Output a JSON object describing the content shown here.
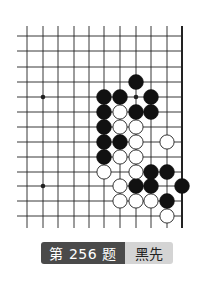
{
  "problem": {
    "title": "第 256 题",
    "to_play": "黑先"
  },
  "board": {
    "grid": {
      "x": [
        27,
        43,
        58,
        74,
        89,
        104,
        120,
        136,
        151,
        167,
        182
      ],
      "y": [
        36,
        51,
        67,
        82,
        97,
        112,
        127,
        142,
        157,
        172,
        186,
        201,
        216
      ],
      "x_extend_left": 17,
      "y_extend_top": 26,
      "y_extend_bottom": 228,
      "right_edge_col": 10
    },
    "star_points": [
      {
        "col": 1,
        "row": 4
      },
      {
        "col": 7,
        "row": 4
      },
      {
        "col": 1,
        "row": 10
      }
    ],
    "stones": {
      "black": [
        {
          "col": 7,
          "row": 3
        },
        {
          "col": 5,
          "row": 4
        },
        {
          "col": 6,
          "row": 4
        },
        {
          "col": 8,
          "row": 4
        },
        {
          "col": 5,
          "row": 5
        },
        {
          "col": 7,
          "row": 5
        },
        {
          "col": 8,
          "row": 5
        },
        {
          "col": 5,
          "row": 6
        },
        {
          "col": 5,
          "row": 7
        },
        {
          "col": 6,
          "row": 7
        },
        {
          "col": 5,
          "row": 8
        },
        {
          "col": 8,
          "row": 9
        },
        {
          "col": 9,
          "row": 9
        },
        {
          "col": 7,
          "row": 10
        },
        {
          "col": 8,
          "row": 10
        },
        {
          "col": 10,
          "row": 10
        },
        {
          "col": 9,
          "row": 11
        }
      ],
      "white": [
        {
          "col": 6,
          "row": 5
        },
        {
          "col": 6,
          "row": 6
        },
        {
          "col": 7,
          "row": 6
        },
        {
          "col": 7,
          "row": 7
        },
        {
          "col": 9,
          "row": 7
        },
        {
          "col": 6,
          "row": 8
        },
        {
          "col": 7,
          "row": 8
        },
        {
          "col": 5,
          "row": 9
        },
        {
          "col": 7,
          "row": 9
        },
        {
          "col": 6,
          "row": 10
        },
        {
          "col": 6,
          "row": 11
        },
        {
          "col": 7,
          "row": 11
        },
        {
          "col": 8,
          "row": 11
        },
        {
          "col": 9,
          "row": 12
        }
      ]
    },
    "colors": {
      "line": "#222222",
      "black_stone": "#111111",
      "white_stone": "#ffffff"
    }
  }
}
